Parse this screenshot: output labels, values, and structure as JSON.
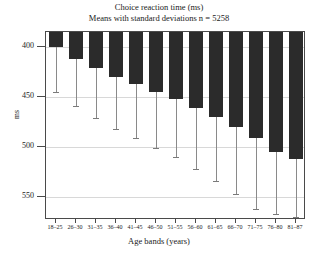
{
  "chart_data": {
    "type": "bar",
    "title": "Choice reaction time (ms)",
    "subtitle": "Means with standard deviations n = 5258",
    "xlabel": "Age bands (years)",
    "ylabel": "ms",
    "grid": true,
    "legend": "none",
    "y_inverted": true,
    "ylim": [
      385,
      573
    ],
    "yticks": [
      400,
      450,
      500,
      550
    ],
    "ytick_labels": [
      "400",
      "450",
      "500",
      "550"
    ],
    "categories": [
      "18–25",
      "26–30",
      "31–35",
      "36–40",
      "41–45",
      "46–50",
      "51–55",
      "56–60",
      "61–65",
      "66–70",
      "71–75",
      "76–80",
      "81–87"
    ],
    "series": [
      {
        "name": "Mean choice reaction time",
        "values": [
          400,
          412,
          421,
          430,
          437,
          445,
          452,
          461,
          470,
          480,
          491,
          505,
          512
        ],
        "errors": [
          45,
          47,
          50,
          52,
          54,
          56,
          58,
          61,
          64,
          67,
          71,
          62,
          58
        ],
        "upper_whisker": [
          445,
          459,
          471,
          482,
          491,
          501,
          510,
          522,
          534,
          547,
          562,
          567,
          570
        ]
      }
    ]
  }
}
